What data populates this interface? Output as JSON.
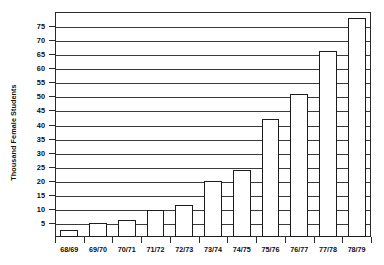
{
  "chart_data": {
    "type": "bar",
    "title": "",
    "subtitle": "",
    "xlabel": "",
    "ylabel": "Thousand Female Students",
    "categories": [
      "68/69",
      "69/70",
      "70/71",
      "71/72",
      "72/73",
      "73/74",
      "74/75",
      "75/76",
      "76/77",
      "77/78",
      "78/79"
    ],
    "values": [
      2.5,
      5,
      6,
      9.5,
      11.5,
      20,
      24,
      42,
      51,
      66,
      78
    ],
    "series": [
      {
        "name": "Thousand Female Students",
        "values": [
          2.5,
          5,
          6,
          9.5,
          11.5,
          20,
          24,
          42,
          51,
          66,
          78
        ]
      }
    ],
    "ylim": [
      0,
      80
    ],
    "xlim_categories": 11,
    "ytick_values": [
      5,
      10,
      15,
      20,
      25,
      30,
      35,
      40,
      45,
      50,
      55,
      60,
      65,
      70,
      75
    ],
    "ytick_labels": [
      "5",
      "10",
      "15",
      "20",
      "25",
      "30",
      "35",
      "40",
      "45",
      "50",
      "55",
      "60",
      "65",
      "70",
      "75"
    ],
    "gridlines": "horizontal",
    "grid": true,
    "legend": null,
    "legend_position": "none",
    "bar_fill_color": "#ffffff",
    "bar_edge_color": "#1c1c1c",
    "axis_color": "#2b2b2b",
    "grid_color": "#3a3a3a",
    "background_color": "#ffffff",
    "annotations": []
  }
}
